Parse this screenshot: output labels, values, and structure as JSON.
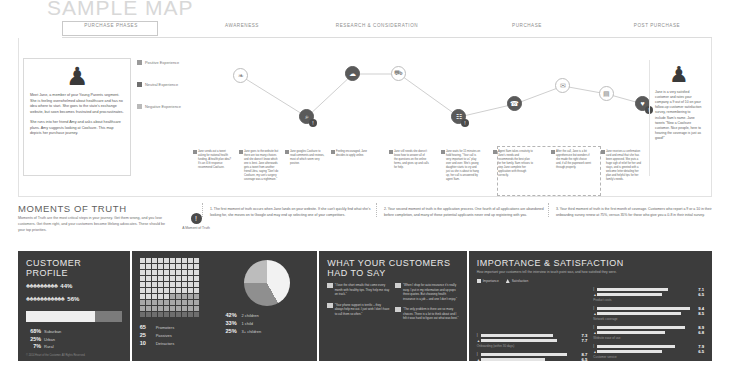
{
  "title": "SAMPLE MAP",
  "journey": {
    "phases_header": "PURCHASE PHASES",
    "phases": [
      {
        "label": "AWARENESS",
        "left": 120,
        "width": 120
      },
      {
        "label": "RESEARCH & CONSIDERATION",
        "left": 215,
        "width": 200
      },
      {
        "label": "PURCHASE",
        "left": 390,
        "width": 150
      },
      {
        "label": "POST PURCHASE",
        "left": 520,
        "width": 150
      }
    ],
    "persona": {
      "figure_icon": "person-standing-icon",
      "paragraphs": [
        "Meet Jane, a member of your Young Parents segment. She is feeling overwhelmed about healthcare and has no idea where to start. She goes to the state's exchange website, but soon becomes frustrated and procrastinates.",
        "She runs into her friend Amy and asks about healthcare plans. Amy suggests looking at Coolsure. This map depicts her purchase journey."
      ]
    },
    "legend": [
      {
        "label": "Positive Experience",
        "kind": "pos"
      },
      {
        "label": "Neutral Experience",
        "kind": "neu"
      },
      {
        "label": "Negative Experience",
        "kind": "neg"
      }
    ],
    "nodes": [
      {
        "icon": "twitter-bird-icon",
        "glyph": "❧",
        "x": 38,
        "y": 12,
        "dark": false
      },
      {
        "icon": "search-web-icon",
        "glyph": "⌕",
        "x": 104,
        "y": 53,
        "dark": true,
        "mot": "1"
      },
      {
        "icon": "cloud-icon",
        "glyph": "☁",
        "x": 150,
        "y": 10,
        "dark": true
      },
      {
        "icon": "shopping-cart-icon",
        "glyph": "⛟",
        "x": 196,
        "y": 10,
        "dark": false
      },
      {
        "icon": "document-form-icon",
        "glyph": "☷",
        "x": 256,
        "y": 53,
        "dark": true,
        "mot": "2"
      },
      {
        "icon": "phone-call-icon",
        "glyph": "☎",
        "x": 312,
        "y": 40,
        "dark": true
      },
      {
        "icon": "mail-envelope-icon",
        "glyph": "✉",
        "x": 360,
        "y": 22,
        "dark": false
      },
      {
        "icon": "card-icon",
        "glyph": "▤",
        "x": 404,
        "y": 30,
        "dark": false
      },
      {
        "icon": "heart-care-icon",
        "glyph": "♥",
        "x": 440,
        "y": 40,
        "dark": true,
        "mot": "3"
      }
    ],
    "cards": [
      {
        "x": 0,
        "text": "Jane sends out a tweet asking for national health funding. A health plan idea? It's an ill-fit response recommend Coolsure."
      },
      {
        "x": 46,
        "text": "Jane goes to the website but there are too many choices and she doesn't know which one is best. Jane afterwards gets a tweet from another friend Libra, saying \"Don't do Coolsure, my son's surgery coverage was a nightmare.\""
      },
      {
        "x": 92,
        "text": "Jane googles Coolsure to read comments and reviews, most of which seem very positive."
      },
      {
        "x": 138,
        "text": "Feeling encouraged, Jane decides to apply online."
      },
      {
        "x": 196,
        "text": "Jane still needs she doesn't know how to answer all of the questions on the online forms, and gives up and calls for help."
      },
      {
        "x": 248,
        "text": "Jane waits for 15 minutes on hold hearing, \"Your call is very important to us\" play over and over. She's young daughter starts to cry and just as she is about to hang up, her call is answered by agent Sam."
      },
      {
        "x": 300,
        "text": "Agent Sam takes creativity to Jane's needs and recommends the best plan for her family. Sam refuses to step Jane complete her application with through correctly."
      },
      {
        "x": 358,
        "text": "After the call, Jane is a bit apprehensive but wonders if she made the right choice and, if all the paperwork went through properly."
      },
      {
        "x": 408,
        "text": "Jane receives a confirmation card and email that she has been approved. She puts a huge sigh of relief for her and stays, and is greeted with a welcome letter detailing her plan and helpful tips for her family's needs."
      }
    ],
    "end_person": {
      "figure_icon": "person-standing-icon",
      "text": "Jane is a very satisfied customer and rates your company a 9 out of 10 on your follow-up customer satisfaction survey, remembering to include Sam's name. Jane tweets \"New a Coolsure customer. Nice people, here to hearing the coverage is just as good!\""
    }
  },
  "moments_of_truth": {
    "title": "MOMENTS OF TRUTH",
    "description": "Moments of Truth are the most critical steps in your journey. Get them wrong, and you lose customers. Get them right, and your customers become lifelong advocates. These should be your top priorities.",
    "icon_label": "A Moment of Truth",
    "icon": "exclamation-circle-icon",
    "items": [
      {
        "num": "1.",
        "text": "The first moment of truth occurs when Jane lands on your website. If she can't quickly find what she's looking for, she moves on to Google and may end up selecting one of your competitors."
      },
      {
        "num": "2.",
        "text": "Your second moment of truth is the application process. One fourth of all applications are abandoned before completion, and many of these potential applicants never end up registering with you."
      },
      {
        "num": "3.",
        "text": "Your third moment of truth is the first month of coverage. Customers who report a 9 or a 10 in their onboarding survey renew at 75%, versus 35% for those who give you a 0-8 in their initial survey."
      }
    ]
  },
  "customer_profile": {
    "title": "CUSTOMER PROFILE",
    "gender": [
      {
        "pct": "44%",
        "count": 9,
        "icon": "person-pictogram-icon"
      },
      {
        "pct": "56%",
        "count": 11,
        "icon": "person-pictogram-icon"
      }
    ],
    "bar_fill_pct": 72,
    "geo": [
      {
        "pct": "68%",
        "label": "Suburban"
      },
      {
        "pct": "25%",
        "label": "Urban"
      },
      {
        "pct": "7%",
        "label": "Rural"
      }
    ],
    "copyright": "© 2014 Heart of the Customer. All Rights Reserved."
  },
  "nps": {
    "waffle_total": 100,
    "promoters": 65,
    "passives": 25,
    "detractors": 10,
    "legend": [
      {
        "n": "65",
        "label": "Promoters"
      },
      {
        "n": "25",
        "label": "Passives"
      },
      {
        "n": "10",
        "label": "Detractors"
      }
    ]
  },
  "children_pie": {
    "type": "pie",
    "slices": [
      {
        "pct": "42%",
        "label": "2 children",
        "value": 42
      },
      {
        "pct": "33%",
        "label": "1 child",
        "value": 33
      },
      {
        "pct": "25%",
        "label": "3+ children",
        "value": 25
      }
    ]
  },
  "quotes_panel": {
    "title": "WHAT YOUR CUSTOMERS HAD TO SAY",
    "quotes": [
      "\"I love the short emails that come every month with healthy tips. They help me stay on track.\"",
      "\"Your phone support is terrific – they always help me out. I just wish I don't have to call them so often.\"",
      "\"When I shop for auto insurance it's really easy. I put in my information and up pops three quotes. But choosing health insurance is a job – and one I don't enjoy.\"",
      "\"The only problem is there are so many choices. There is a lot to think about and I felt it was hard to figure out what was best.\""
    ]
  },
  "importance_satisfaction": {
    "title": "IMPORTANCE & SATISFACTION",
    "description": "How important your customers tell the interview in touch point was, and how satisfied they were.",
    "legend": [
      {
        "label": "Importance",
        "marker": "importance-marker-icon"
      },
      {
        "label": "Satisfaction",
        "marker": "satisfaction-marker-icon"
      }
    ],
    "scale_max": 10,
    "groups_left": [
      {
        "label": "Onboarding (within 30 days)",
        "importance": 7.3,
        "satisfaction": 7.7
      },
      {
        "label": "Application process",
        "importance": 8.7,
        "satisfaction": 6.5
      }
    ],
    "groups_right": [
      {
        "label": "Product costs",
        "importance": 7.1,
        "satisfaction": 6.5
      },
      {
        "label": "Network coverage",
        "importance": 9.4,
        "satisfaction": 8.5
      },
      {
        "label": "Website ease of use",
        "importance": 8.9,
        "satisfaction": 6.8
      },
      {
        "label": "Customer service",
        "importance": 7.9,
        "satisfaction": 6.5
      },
      {
        "label": "Claims / billing process",
        "importance": 5.5,
        "satisfaction": 4.9
      }
    ]
  }
}
